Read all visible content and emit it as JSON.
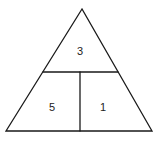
{
  "diagram": {
    "type": "triangle-partition",
    "shape": "triangle",
    "colors": {
      "stroke": "#1a1a1a",
      "text": "#222222",
      "background": "#ffffff"
    },
    "triangle": {
      "apex": [
        82,
        9
      ],
      "bottom_left": [
        6,
        131
      ],
      "bottom_right": [
        152,
        131
      ]
    },
    "horizontal_divider": {
      "y": 72,
      "x1": 43,
      "x2": 118
    },
    "vertical_divider": {
      "x": 80,
      "y1": 72,
      "y2": 131
    },
    "regions": [
      {
        "id": "top",
        "label": "3",
        "x": 80,
        "y": 52
      },
      {
        "id": "bottom-left",
        "label": "5",
        "x": 52,
        "y": 108
      },
      {
        "id": "bottom-right",
        "label": "1",
        "x": 103,
        "y": 108
      }
    ]
  }
}
